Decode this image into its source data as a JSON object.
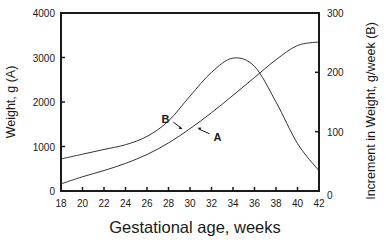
{
  "chart_data": {
    "type": "line",
    "title": "",
    "xlabel": "Gestational age, weeks",
    "ylabel": "Weight, g (A)",
    "y2label": "Increment in Weight, g/week (B)",
    "xlim": [
      18,
      42
    ],
    "ylim": [
      0,
      4000
    ],
    "y2lim": [
      0,
      300
    ],
    "x_ticks": [
      18,
      20,
      22,
      24,
      26,
      28,
      30,
      32,
      34,
      36,
      38,
      40,
      42
    ],
    "y_ticks": [
      0,
      1000,
      2000,
      3000,
      4000
    ],
    "y2_ticks": [
      0,
      100,
      200,
      300
    ],
    "grid": false,
    "legend": "none (curves labeled inline)",
    "x": [
      18,
      20,
      22,
      24,
      26,
      28,
      30,
      32,
      34,
      36,
      38,
      40,
      42
    ],
    "series": [
      {
        "name": "A",
        "axis": "left",
        "description": "Weight, g",
        "values": [
          160,
          320,
          460,
          620,
          820,
          1080,
          1400,
          1760,
          2150,
          2550,
          2950,
          3270,
          3350
        ]
      },
      {
        "name": "B",
        "axis": "right",
        "description": "Increment in weight, g/week",
        "values": [
          54,
          62,
          70,
          78,
          92,
          118,
          160,
          200,
          224,
          210,
          150,
          80,
          34
        ]
      }
    ],
    "annotations": [
      {
        "text": "B",
        "arrow_to": [
          29.3,
          104
        ]
      },
      {
        "text": "A",
        "arrow_to": [
          30.7,
          1420
        ]
      }
    ]
  }
}
